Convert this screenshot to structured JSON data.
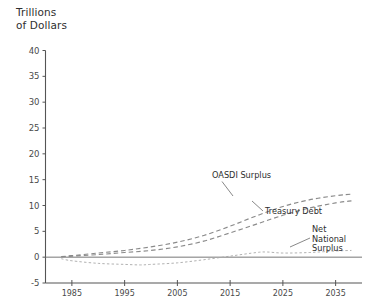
{
  "chart_data": {
    "type": "line",
    "title": "",
    "ylabel": "Trillions\nof Dollars",
    "ylabel_line1": "Trillions",
    "ylabel_line2": "of Dollars",
    "xlabel": "",
    "xlim": [
      1980,
      2040
    ],
    "ylim": [
      -5,
      40
    ],
    "yticks": [
      -5,
      0,
      5,
      10,
      15,
      20,
      25,
      30,
      35,
      40
    ],
    "ytick_labels": [
      "-5",
      "0",
      "5",
      "10",
      "15",
      "20",
      "25",
      "30",
      "35",
      "40"
    ],
    "xticks": [
      1985,
      1995,
      2005,
      2015,
      2025,
      2035
    ],
    "xtick_labels": [
      "1985",
      "1995",
      "2005",
      "2015",
      "2025",
      "2035"
    ],
    "grid": false,
    "legend": "inline-annotations",
    "line_color": "#8c8c8c",
    "zero_line_color": "#777777",
    "axis_color": "#555555",
    "series": [
      {
        "name": "OASDI Surplus",
        "label": "OASDI Surplus",
        "style": "dashed",
        "color": "#8a8a8a",
        "x": [
          1983,
          1985,
          1990,
          1995,
          2000,
          2005,
          2010,
          2015,
          2020,
          2025,
          2030,
          2035,
          2038
        ],
        "values": [
          0.1,
          0.3,
          0.8,
          1.3,
          2.0,
          2.9,
          4.2,
          6.0,
          8.0,
          9.8,
          11.1,
          11.9,
          12.2
        ]
      },
      {
        "name": "Treasury Debt",
        "label": "Treasury Debt",
        "style": "dashed",
        "color": "#8a8a8a",
        "x": [
          1983,
          1985,
          1990,
          1995,
          2000,
          2005,
          2010,
          2015,
          2020,
          2025,
          2030,
          2035,
          2038
        ],
        "values": [
          0.1,
          0.2,
          0.5,
          0.9,
          1.3,
          2.0,
          3.1,
          4.7,
          6.4,
          8.1,
          9.5,
          10.5,
          10.9
        ]
      },
      {
        "name": "Net National Surplus",
        "label_line1": "Net",
        "label_line2": "National",
        "label_line3": "Surplus",
        "style": "dotted",
        "color": "#a8a8a8",
        "x": [
          1983,
          1985,
          1990,
          1995,
          1998,
          2000,
          2005,
          2010,
          2015,
          2020,
          2022,
          2025,
          2030,
          2035,
          2038
        ],
        "values": [
          -0.3,
          -0.7,
          -1.2,
          -1.4,
          -1.5,
          -1.4,
          -1.1,
          -0.5,
          0.2,
          0.9,
          1.0,
          0.8,
          0.9,
          1.2,
          1.3
        ]
      }
    ],
    "annotations": [
      {
        "text": "OASDI Surplus",
        "x": 2021,
        "y": 15.0
      },
      {
        "text": "Treasury Debt",
        "x": 2027,
        "y": 8.6
      },
      {
        "text": "Net National Surplus",
        "x": 2034,
        "y": 5.2
      }
    ]
  }
}
